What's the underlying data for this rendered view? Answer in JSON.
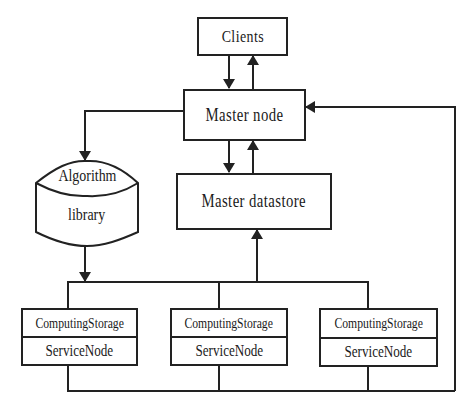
{
  "diagram": {
    "type": "architecture-flowchart",
    "nodes": {
      "clients": {
        "label": "Clients"
      },
      "master_node": {
        "label": "Master node"
      },
      "master_datastore": {
        "label": "Master datastore"
      },
      "algorithm_library": {
        "label_line1": "Algorithm",
        "label_line2": "library"
      },
      "service_nodes": [
        {
          "line1": "ComputingStorage",
          "line2": "ServiceNode"
        },
        {
          "line1": "ComputingStorage",
          "line2": "ServiceNode"
        },
        {
          "line1": "ComputingStorage",
          "line2": "ServiceNode"
        }
      ]
    },
    "edges": [
      {
        "from": "Clients",
        "to": "Master node"
      },
      {
        "from": "Master node",
        "to": "Clients"
      },
      {
        "from": "Master node",
        "to": "Master datastore"
      },
      {
        "from": "Master datastore",
        "to": "Master node"
      },
      {
        "from": "Master node",
        "to": "Algorithm library"
      },
      {
        "from": "Algorithm library",
        "to": "ComputingStorage ServiceNodes"
      },
      {
        "from": "ComputingStorage ServiceNodes",
        "to": "Master datastore"
      },
      {
        "from": "ComputingStorage ServiceNodes",
        "to": "Master node"
      }
    ],
    "colors": {
      "line": "#222222",
      "background": "#ffffff",
      "text": "#1a1a1a"
    }
  }
}
